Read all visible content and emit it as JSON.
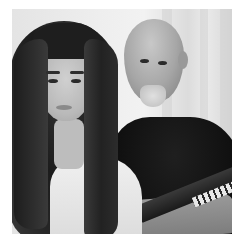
{
  "image": {
    "kind": "photograph",
    "color_mode": "grayscale",
    "description": "Black-and-white photo of a young woman with long dark hair wearing a white top, seated beside a bald older man with a gray goatee in a black t-shirt at a keyboard",
    "frame_color": "#ffffff",
    "subjects": [
      {
        "name": "young-woman",
        "position": "left",
        "hair": "long dark",
        "clothing": "white top"
      },
      {
        "name": "older-man",
        "position": "right",
        "hair": "bald",
        "facial_hair": "gray goatee",
        "clothing": "black t-shirt"
      }
    ],
    "objects": [
      "keyboard"
    ],
    "background": "light curtains"
  }
}
